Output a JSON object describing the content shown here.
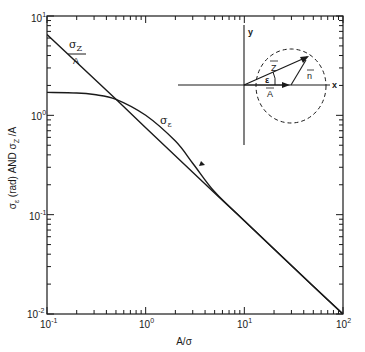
{
  "chart_data": {
    "type": "line",
    "title": "",
    "xlabel": "A/σ",
    "ylabel": "σε (rad) AND σZ /A",
    "xscale": "log",
    "yscale": "log",
    "xlim": [
      0.1,
      100
    ],
    "ylim": [
      0.01,
      10
    ],
    "grid": false,
    "x_tick_labels": [
      "10^-1",
      "10^0",
      "10^1",
      "10^2"
    ],
    "y_tick_labels": [
      "10^1",
      "10^0",
      "10^-1",
      "10^-2"
    ],
    "series": [
      {
        "name": "σZ/A",
        "label_text": "σZ / A",
        "x": [
          0.1,
          0.5,
          1,
          5,
          10,
          50,
          100
        ],
        "values": [
          6.5,
          1.45,
          0.75,
          0.165,
          0.087,
          0.019,
          0.01
        ]
      },
      {
        "name": "σε",
        "label_text": "σε",
        "x": [
          0.1,
          0.2,
          0.3,
          0.5,
          1,
          2,
          3,
          5,
          10,
          50,
          100
        ],
        "values": [
          1.7,
          1.68,
          1.62,
          1.45,
          1.0,
          0.55,
          0.33,
          0.17,
          0.087,
          0.019,
          0.01
        ]
      }
    ],
    "annotations": [
      {
        "text": "σZ / A",
        "near": "upper-left line"
      },
      {
        "text": "σε",
        "near": "curve above line at A/σ≈1.5"
      }
    ],
    "inset_diagram": {
      "axes": [
        "x",
        "y"
      ],
      "vectors": [
        "Z",
        "A",
        "n"
      ],
      "angle_label": "ε",
      "circle": "dashed"
    }
  },
  "labels": {
    "x_title": "A/σ",
    "y_title_sigma_e": "σ",
    "y_title_sub_e": "ε",
    "y_title_mid": " (rad) AND σ",
    "y_title_sub_z": "Z",
    "y_title_end": " /A",
    "xt0": "10",
    "xt0e": "-1",
    "xt1": "10",
    "xt1e": "0",
    "xt2": "10",
    "xt2e": "1",
    "xt3": "10",
    "xt3e": "2",
    "yt0": "10",
    "yt0e": "1",
    "yt1": "10",
    "yt1e": "0",
    "yt2": "10",
    "yt2e": "-1",
    "yt3": "10",
    "yt3e": "-2",
    "sz_sigma": "σ",
    "sz_sub": "Z",
    "sz_den": "A",
    "se_sigma": "σ",
    "se_sub": "ε",
    "inset_x": "x",
    "inset_y": "y",
    "inset_Z": "Z",
    "inset_A": "A",
    "inset_n": "n",
    "inset_eps": "ε"
  },
  "colors": {
    "ink": "#1a1a1a",
    "background": "#ffffff"
  }
}
